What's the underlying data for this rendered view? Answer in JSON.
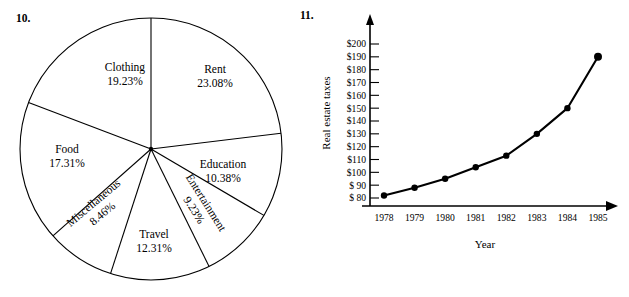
{
  "figures": {
    "pie": {
      "number_label": "10.",
      "chart_data": {
        "type": "pie",
        "title": "",
        "categories": [
          "Rent",
          "Education",
          "Entertainment",
          "Travel",
          "Miscellaneous",
          "Food",
          "Clothing"
        ],
        "values": [
          23.08,
          10.38,
          9.23,
          12.31,
          8.46,
          17.31,
          19.23
        ],
        "value_labels": [
          "23.08%",
          "10.38%",
          "9.23%",
          "12.31%",
          "8.46%",
          "17.31%",
          "19.23%"
        ],
        "unit": "%",
        "start_angle_deg": 0,
        "direction": "clockwise",
        "legend": "none",
        "slice_fill": "#ffffff",
        "slice_stroke": "#000000",
        "slices": [
          {
            "name": "Rent",
            "label": "Rent",
            "pct": "23.08%",
            "value": 23.08,
            "rotate": 0
          },
          {
            "name": "Education",
            "label": "Education",
            "pct": "10.38%",
            "value": 10.38,
            "rotate": 0
          },
          {
            "name": "Entertainment",
            "label": "Entertainment",
            "pct": "9.23%",
            "value": 9.23,
            "rotate": -58
          },
          {
            "name": "Travel",
            "label": "Travel",
            "pct": "12.31%",
            "value": 12.31,
            "rotate": 0
          },
          {
            "name": "Miscellaneous",
            "label": "Miscellaneous",
            "pct": "8.46%",
            "value": 8.46,
            "rotate": -40
          },
          {
            "name": "Food",
            "label": "Food",
            "pct": "17.31%",
            "value": 17.31,
            "rotate": 0
          },
          {
            "name": "Clothing",
            "label": "Clothing",
            "pct": "19.23%",
            "value": 19.23,
            "rotate": 0
          }
        ]
      }
    },
    "line": {
      "number_label": "11.",
      "chart_data": {
        "type": "line",
        "title": "",
        "xlabel": "Year",
        "ylabel": "Real estate taxes",
        "x": [
          1978,
          1979,
          1980,
          1981,
          1982,
          1983,
          1984,
          1985
        ],
        "x_tick_labels": [
          "1978",
          "1979",
          "1980",
          "1981",
          "1982",
          "1983",
          "1984",
          "1985"
        ],
        "values": [
          82,
          88,
          95,
          104,
          113,
          130,
          150,
          190
        ],
        "ylim": [
          80,
          200
        ],
        "y_tick_values": [
          80,
          90,
          100,
          110,
          120,
          130,
          140,
          150,
          160,
          170,
          180,
          190,
          200
        ],
        "y_tick_labels": [
          "$ 80",
          "$ 90",
          "$100",
          "$110",
          "$120",
          "$130",
          "$140",
          "$150",
          "$160",
          "$170",
          "$180",
          "$190",
          "$200"
        ],
        "grid": false,
        "legend": "none",
        "line_color": "#000000",
        "marker": "circle",
        "marker_color": "#000000"
      }
    }
  }
}
